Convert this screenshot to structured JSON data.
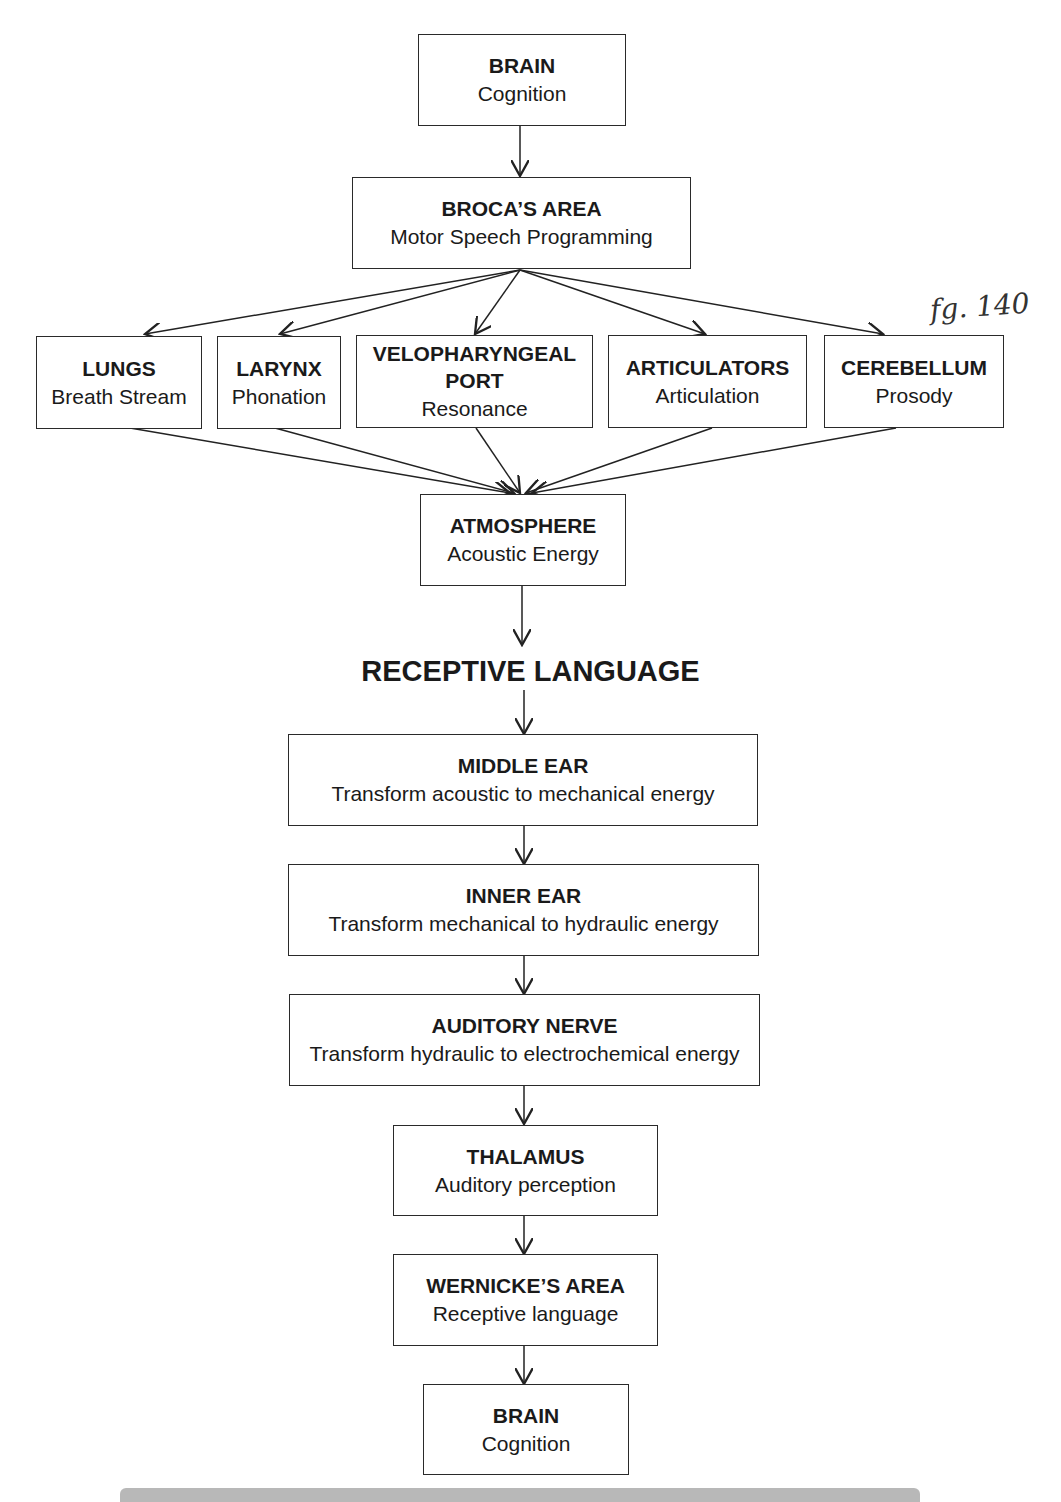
{
  "diagram": {
    "annotation": "fg. 140",
    "expressive_chain": {
      "brain_top": {
        "title": "BRAIN",
        "subtitle": "Cognition"
      },
      "broca": {
        "title": "BROCA’S AREA",
        "subtitle": "Motor Speech Programming"
      },
      "subsystems": [
        {
          "title": "LUNGS",
          "subtitle": "Breath Stream"
        },
        {
          "title": "LARYNX",
          "subtitle": "Phonation"
        },
        {
          "title": "VELOPHARYNGEAL PORT",
          "title_line1": "VELOPHARYNGEAL",
          "title_line2": "PORT",
          "subtitle": "Resonance"
        },
        {
          "title": "ARTICULATORS",
          "subtitle": "Articulation"
        },
        {
          "title": "CEREBELLUM",
          "subtitle": "Prosody"
        }
      ],
      "atmosphere": {
        "title": "ATMOSPHERE",
        "subtitle": "Acoustic Energy"
      }
    },
    "section_heading": "RECEPTIVE LANGUAGE",
    "receptive_chain": [
      {
        "title": "MIDDLE EAR",
        "subtitle": "Transform acoustic to mechanical energy"
      },
      {
        "title": "INNER EAR",
        "subtitle": "Transform mechanical to hydraulic energy"
      },
      {
        "title": "AUDITORY NERVE",
        "subtitle": "Transform hydraulic to electrochemical energy"
      },
      {
        "title": "THALAMUS",
        "subtitle": "Auditory perception"
      },
      {
        "title": "WERNICKE’S AREA",
        "subtitle": "Receptive language"
      },
      {
        "title": "BRAIN",
        "subtitle": "Cognition"
      }
    ]
  }
}
